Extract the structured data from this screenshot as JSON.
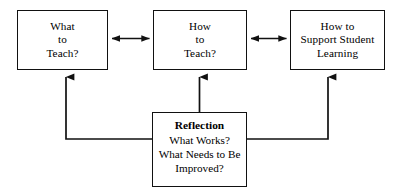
{
  "diagram": {
    "background_color": "#ffffff",
    "line_color": "#111111",
    "text_color": "#000000",
    "nodes": [
      {
        "id": "what-to-teach",
        "lines": [
          "What",
          "to",
          "Teach?"
        ],
        "bold_header": null
      },
      {
        "id": "how-to-teach",
        "lines": [
          "How",
          "to",
          "Teach?"
        ],
        "bold_header": null
      },
      {
        "id": "support-student-learning",
        "lines": [
          "How to",
          "Support Student",
          "Learning"
        ],
        "bold_header": null
      },
      {
        "id": "reflection",
        "bold_header": "Reflection",
        "lines": [
          "What Works?",
          "What Needs to Be",
          "Improved?"
        ]
      }
    ],
    "connectors": [
      {
        "id": "what-teach-to-how-teach",
        "type": "double-arrow",
        "orientation": "horizontal",
        "from": "what-to-teach",
        "to": "how-to-teach"
      },
      {
        "id": "how-teach-to-support-learning",
        "type": "double-arrow",
        "orientation": "horizontal",
        "from": "how-to-teach",
        "to": "support-student-learning"
      },
      {
        "id": "reflection-to-what-teach",
        "type": "single-arrow",
        "orientation": "elbow-left-up",
        "from": "reflection",
        "to": "what-to-teach"
      },
      {
        "id": "reflection-to-how-teach",
        "type": "single-arrow",
        "orientation": "vertical-up",
        "from": "reflection",
        "to": "how-to-teach"
      },
      {
        "id": "reflection-to-support-learning",
        "type": "single-arrow",
        "orientation": "elbow-right-up",
        "from": "reflection",
        "to": "support-student-learning"
      }
    ]
  }
}
